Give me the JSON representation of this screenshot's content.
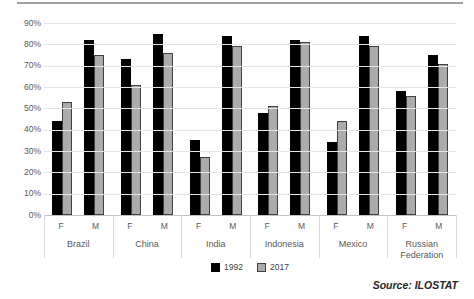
{
  "chart_data": {
    "type": "bar",
    "title": "",
    "xlabel": "",
    "ylabel": "",
    "ylim": [
      0,
      90
    ],
    "y_tick_labels": [
      "0%",
      "10%",
      "20%",
      "30%",
      "40%",
      "50%",
      "60%",
      "70%",
      "80%",
      "90%"
    ],
    "grid": true,
    "legend_position": "bottom",
    "countries": [
      "Brazil",
      "China",
      "India",
      "Indonesia",
      "Mexico",
      "Russian Federation"
    ],
    "subcategories": [
      "F",
      "M"
    ],
    "categories": [
      "Brazil F",
      "Brazil M",
      "China F",
      "China M",
      "India F",
      "India M",
      "Indonesia F",
      "Indonesia M",
      "Mexico F",
      "Mexico M",
      "Russian Federation F",
      "Russian Federation M"
    ],
    "series": [
      {
        "name": "1992",
        "color": "#000000",
        "border_color": "#000000",
        "values": [
          44,
          82,
          73,
          85,
          35,
          84,
          48,
          82,
          34,
          84,
          58,
          75
        ]
      },
      {
        "name": "2017",
        "color": "#ababab",
        "border_color": "#404040",
        "values": [
          53,
          75,
          61,
          76,
          27,
          79,
          51,
          81,
          44,
          79,
          56,
          71
        ]
      }
    ],
    "source_note": "Source: ILOSTAT"
  },
  "legend": {
    "items": [
      {
        "label": "1992",
        "color": "#000000",
        "border_color": "#000000"
      },
      {
        "label": "2017",
        "color": "#ababab",
        "border_color": "#404040"
      }
    ]
  },
  "colors": {
    "gridline": "#e4e4e4",
    "axis_line": "#c2c2c2",
    "axis_text": "#595959",
    "top_rule": "#9e9e9e"
  }
}
